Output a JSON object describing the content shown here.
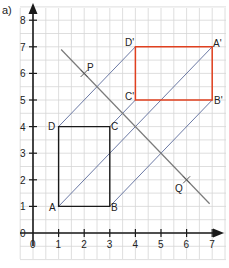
{
  "part_label": "a)",
  "axes": {
    "x": {
      "min": 0,
      "max": 7,
      "ticks": [
        "0",
        "1",
        "2",
        "3",
        "4",
        "5",
        "6",
        "7"
      ]
    },
    "y": {
      "min": 0,
      "max": 8,
      "ticks": [
        "0",
        "1",
        "2",
        "3",
        "4",
        "5",
        "6",
        "7",
        "8"
      ]
    }
  },
  "colors": {
    "grid": "#d6d6d6",
    "axis": "#1a1a1a",
    "original_shape": "#1a1a1a",
    "image_shape": "#e0401f",
    "projection_lines": "#5a6a9a",
    "mirror_line": "#7a7a7a"
  },
  "shapes": {
    "original": {
      "name": "ABCD",
      "vertices": [
        {
          "label": "A",
          "x": 1,
          "y": 1
        },
        {
          "label": "B",
          "x": 3,
          "y": 1
        },
        {
          "label": "C",
          "x": 3,
          "y": 4
        },
        {
          "label": "D",
          "x": 1,
          "y": 4
        }
      ]
    },
    "image": {
      "name": "A'B'C'D'",
      "vertices": [
        {
          "label": "A'",
          "x": 7,
          "y": 7
        },
        {
          "label": "B'",
          "x": 7,
          "y": 5
        },
        {
          "label": "C'",
          "x": 4,
          "y": 5
        },
        {
          "label": "D'",
          "x": 4,
          "y": 7
        }
      ]
    }
  },
  "projection_lines": [
    {
      "from": "A",
      "to": "A'",
      "x1": 1,
      "y1": 1,
      "x2": 7,
      "y2": 7
    },
    {
      "from": "B",
      "to": "B'",
      "x1": 3,
      "y1": 1,
      "x2": 7,
      "y2": 5
    },
    {
      "from": "C",
      "to": "C'",
      "x1": 3,
      "y1": 4,
      "x2": 4,
      "y2": 5
    },
    {
      "from": "D",
      "to": "D'",
      "x1": 1,
      "y1": 4,
      "x2": 4,
      "y2": 7
    }
  ],
  "mirror_line": {
    "equation": "y = 8 - x",
    "x1": 1.1,
    "y1": 6.9,
    "x2": 6.9,
    "y2": 1.1,
    "points": [
      {
        "label": "P",
        "x": 2,
        "y": 6
      },
      {
        "label": "Q",
        "x": 6,
        "y": 2
      }
    ]
  },
  "labels": {
    "A": "A",
    "B": "B",
    "C": "C",
    "D": "D",
    "A_prime": "A'",
    "B_prime": "B'",
    "C_prime": "C'",
    "D_prime": "D'",
    "P": "P",
    "Q": "Q"
  }
}
